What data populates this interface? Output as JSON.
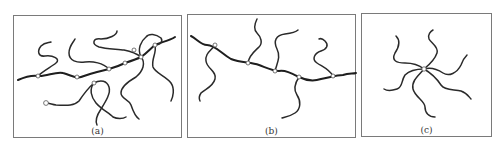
{
  "figure": {
    "panels": [
      {
        "id": "a",
        "label": "(a)",
        "description": "randomly branched polymer network"
      },
      {
        "id": "b",
        "label": "(b)",
        "description": "comb polymer with branches on backbone"
      },
      {
        "id": "c",
        "label": "(c)",
        "description": "star polymer with arms from central node"
      }
    ],
    "colors": {
      "line": "#2a2a2a",
      "border": "#7a7a7a",
      "node_fill": "#ffffff"
    }
  }
}
